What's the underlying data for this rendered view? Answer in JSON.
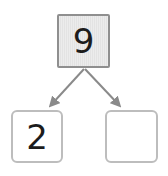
{
  "diagram": {
    "type": "number-bond",
    "whole": {
      "value": "9"
    },
    "parts": [
      {
        "value": "2",
        "state": "filled"
      },
      {
        "value": "",
        "state": "empty-answer"
      }
    ],
    "colors": {
      "whole_box_border": "#8f8f8f",
      "whole_box_fill": "#e8e8e8",
      "part_box_border": "#bdbdbd",
      "part_box_fill": "#ffffff",
      "arrow": "#8a8a8a",
      "digit": "#1c1c1c",
      "background": "#ffffff"
    }
  }
}
